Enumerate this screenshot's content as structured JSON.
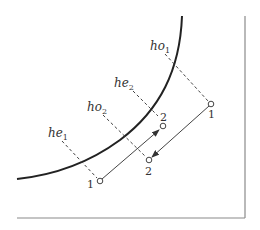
{
  "diagram": {
    "colors": {
      "curve": "#222222",
      "frame": "#888888",
      "dashed": "#444444",
      "arrow": "#444444",
      "point_fill": "#ffffff",
      "point_stroke": "#444444",
      "text": "#333333"
    },
    "labels": {
      "ho1": {
        "base": "ho",
        "sub": "1"
      },
      "he2": {
        "base": "he",
        "sub": "2"
      },
      "ho2": {
        "base": "ho",
        "sub": "2"
      },
      "he1": {
        "base": "he",
        "sub": "1"
      }
    },
    "points": {
      "outer_1": {
        "label": "1"
      },
      "outer_2": {
        "label": "2"
      },
      "inner_1": {
        "label": "1"
      },
      "inner_2": {
        "label": "2"
      }
    }
  }
}
